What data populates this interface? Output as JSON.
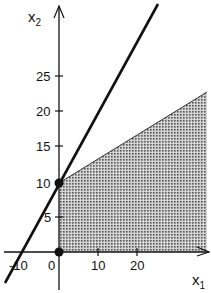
{
  "diagram": {
    "type": "linear-programming-feasible-region",
    "axes": {
      "x_label": "x",
      "x_subscript": "1",
      "y_label": "x",
      "y_subscript": "2",
      "x_ticks": [
        "-10",
        "0",
        "10",
        "20"
      ],
      "y_ticks": [
        "5",
        "10",
        "15",
        "20",
        "25"
      ]
    },
    "lines": [
      {
        "name": "constraint-line",
        "equation": "x2 = 2x1 + 10",
        "style": "thick solid black"
      }
    ],
    "feasible_region": {
      "description": "shaded region x1 >= 0, x2 >= 0, bounded above by line from (0,10) with slope ~0.5",
      "fill": "#9a9a9a",
      "vertices": [
        [
          0,
          0
        ],
        [
          0,
          10
        ],
        [
          38,
          23
        ],
        [
          38,
          0
        ]
      ]
    },
    "points": [
      {
        "label": "(0,10)",
        "x1": 0,
        "x2": 10
      },
      {
        "label": "(0,0)",
        "x1": 0,
        "x2": 0
      }
    ],
    "colors": {
      "axis": "#111111",
      "line": "#111111",
      "shade": "#9a9a9a",
      "background": "#ffffff"
    }
  }
}
